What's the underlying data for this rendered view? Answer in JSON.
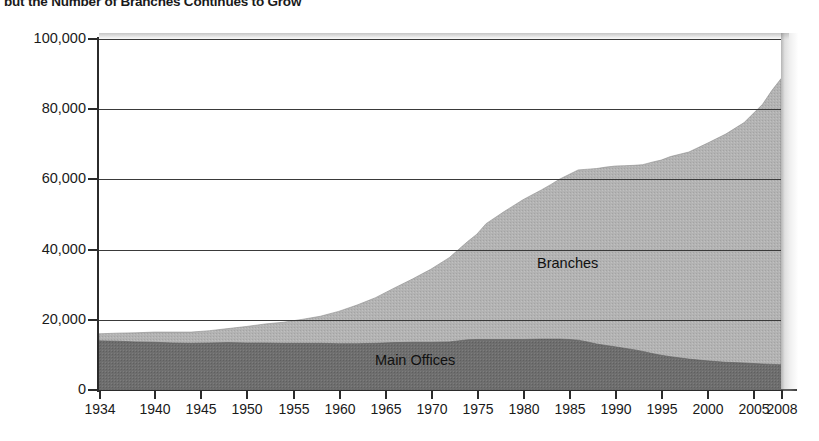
{
  "title": "but the Number of Branches Continues to Grow",
  "series_labels": {
    "branches": "Branches",
    "main_offices": "Main Offices"
  },
  "colors": {
    "branches_fill": "#b2b2b2",
    "main_offices_fill": "#6d6d6d",
    "axis": "#2b2b2b",
    "grid": "#3a3a3a",
    "text": "#1a1a1a"
  },
  "chart_data": {
    "type": "area",
    "stacked": true,
    "title": "but the Number of Branches Continues to Grow",
    "xlabel": "",
    "ylabel": "",
    "grid": true,
    "legend": "in-plot labels",
    "xlim": [
      1934,
      2008
    ],
    "ylim": [
      0,
      100000
    ],
    "yticks": [
      0,
      20000,
      40000,
      60000,
      80000,
      100000
    ],
    "ytick_labels": [
      "0",
      "20,000",
      "40,000",
      "60,000",
      "80,000",
      "100,000"
    ],
    "xticks": [
      1934,
      1940,
      1945,
      1950,
      1955,
      1960,
      1965,
      1970,
      1975,
      1980,
      1985,
      1990,
      1995,
      2000,
      2005,
      2008
    ],
    "xtick_labels": [
      "1934",
      "1940",
      "1945",
      "1950",
      "1955",
      "1960",
      "1965",
      "1970",
      "1975",
      "1980",
      "1985",
      "1990",
      "1995",
      "2000",
      "2005",
      "2008"
    ],
    "x": [
      1934,
      1936,
      1938,
      1940,
      1942,
      1944,
      1946,
      1948,
      1950,
      1952,
      1954,
      1956,
      1958,
      1960,
      1962,
      1964,
      1966,
      1968,
      1970,
      1972,
      1974,
      1975,
      1976,
      1978,
      1980,
      1982,
      1983,
      1984,
      1985,
      1986,
      1987,
      1988,
      1989,
      1990,
      1991,
      1992,
      1993,
      1994,
      1995,
      1996,
      1998,
      2000,
      2002,
      2004,
      2006,
      2007,
      2008
    ],
    "series": [
      {
        "name": "Main Offices",
        "values": [
          14000,
          13900,
          13700,
          13600,
          13400,
          13300,
          13400,
          13500,
          13400,
          13400,
          13300,
          13300,
          13300,
          13200,
          13200,
          13300,
          13500,
          13600,
          13600,
          13700,
          14300,
          14400,
          14400,
          14400,
          14400,
          14500,
          14500,
          14500,
          14400,
          14200,
          13700,
          13100,
          12700,
          12300,
          11900,
          11500,
          11000,
          10400,
          9900,
          9500,
          8800,
          8300,
          7900,
          7700,
          7400,
          7300,
          7200
        ]
      },
      {
        "name": "Branches",
        "values": [
          2000,
          2300,
          2600,
          2900,
          3100,
          3200,
          3500,
          4000,
          4700,
          5400,
          6000,
          6800,
          7700,
          9200,
          11000,
          13000,
          15500,
          18000,
          20800,
          24000,
          28000,
          30000,
          33000,
          36500,
          39800,
          42500,
          44000,
          45600,
          47000,
          48500,
          49200,
          50000,
          50800,
          51500,
          52000,
          52500,
          53200,
          54500,
          55600,
          57000,
          59000,
          62000,
          65000,
          68500,
          74000,
          78000,
          81500
        ]
      }
    ],
    "totals": [
      16000,
      16200,
      16300,
      16500,
      16500,
      16500,
      16900,
      17500,
      18100,
      18800,
      19300,
      20100,
      21000,
      22400,
      24200,
      26300,
      29000,
      31600,
      34400,
      37700,
      42300,
      44400,
      47400,
      50900,
      54200,
      57000,
      58500,
      60100,
      61400,
      62700,
      62900,
      63100,
      63500,
      63800,
      63900,
      64000,
      64200,
      64900,
      65500,
      66500,
      67800,
      70300,
      72900,
      76200,
      81400,
      85300,
      88700
    ]
  }
}
